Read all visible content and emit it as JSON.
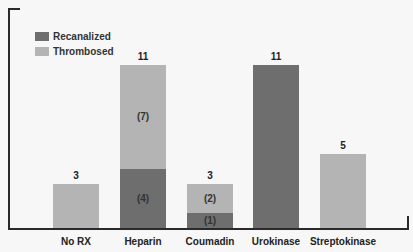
{
  "chart_data": {
    "type": "bar",
    "stacked": true,
    "title": "",
    "xlabel": "",
    "ylabel": "",
    "ylim": [
      0,
      11
    ],
    "grid": false,
    "legend_position": "top-left",
    "categories": [
      "No RX",
      "Heparin",
      "Coumadin",
      "Urokinase",
      "Streptokinase"
    ],
    "series": [
      {
        "name": "Recanalized",
        "color": "#6e6e6e",
        "values": [
          0,
          4,
          1,
          11,
          0
        ],
        "labels": [
          "",
          "(4)",
          "(1)",
          "",
          ""
        ]
      },
      {
        "name": "Thrombosed",
        "color": "#b4b4b4",
        "values": [
          3,
          7,
          2,
          0,
          5
        ],
        "labels": [
          "",
          "(7)",
          "(2)",
          "",
          ""
        ]
      }
    ],
    "totals": [
      3,
      11,
      3,
      11,
      5
    ]
  },
  "legend": {
    "items": [
      {
        "label": "Recanalized",
        "color": "#6e6e6e"
      },
      {
        "label": "Thrombosed",
        "color": "#b4b4b4"
      }
    ]
  }
}
